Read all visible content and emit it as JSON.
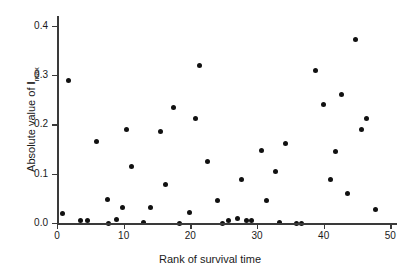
{
  "chart_data": {
    "type": "scatter",
    "title": "",
    "xlabel": "Rank of survival time",
    "ylabel_prefix": "Absolute value of ",
    "ylabel_symbol": "I",
    "ylabel_subscript": "max",
    "ylabel_full": "Absolute value of Imax",
    "xlim": [
      0,
      51
    ],
    "ylim": [
      0.0,
      0.42
    ],
    "xticks": [
      0,
      10,
      20,
      30,
      40,
      50
    ],
    "xtick_labels": [
      "0",
      "10",
      "20",
      "30",
      "40",
      "50"
    ],
    "yticks": [
      0.0,
      0.1,
      0.2,
      0.3,
      0.4
    ],
    "ytick_labels": [
      "0.0",
      "0.1",
      "0.2",
      "0.3",
      "0.4"
    ],
    "grid": false,
    "legend": null,
    "marker": "filled-circle",
    "marker_color": "#111111",
    "axis_color": "#3a3a3a",
    "background": "#ffffff",
    "x": [
      0.8,
      1.7,
      3.5,
      4.5,
      5.9,
      7.6,
      7.7,
      8.9,
      9.8,
      10.4,
      11.2,
      12.9,
      14.0,
      15.5,
      16.2,
      17.4,
      18.3,
      19.9,
      20.7,
      21.3,
      22.6,
      24.0,
      24.8,
      25.7,
      27.1,
      27.6,
      28.4,
      29.1,
      30.6,
      31.4,
      32.8,
      33.4,
      34.3,
      35.9,
      36.7,
      38.8,
      40.0,
      41.0,
      41.8,
      42.7,
      43.6,
      44.8,
      45.6,
      46.4,
      47.8
    ],
    "y": [
      0.02,
      0.29,
      0.006,
      0.006,
      0.165,
      0.047,
      0.0,
      0.008,
      0.032,
      0.19,
      0.114,
      0.002,
      0.031,
      0.185,
      0.079,
      0.234,
      0.0,
      0.021,
      0.213,
      0.319,
      0.124,
      0.046,
      0.0,
      0.005,
      0.009,
      0.088,
      0.006,
      0.005,
      0.148,
      0.045,
      0.104,
      0.002,
      0.161,
      0.0,
      0.0,
      0.31,
      0.24,
      0.088,
      0.145,
      0.26,
      0.059,
      0.372,
      0.19,
      0.212,
      0.028
    ],
    "n_points": 45
  },
  "points": [
    {
      "x": 0.8,
      "y": 0.02
    },
    {
      "x": 1.7,
      "y": 0.29
    },
    {
      "x": 3.5,
      "y": 0.006
    },
    {
      "x": 4.5,
      "y": 0.006
    },
    {
      "x": 5.9,
      "y": 0.165
    },
    {
      "x": 7.6,
      "y": 0.047
    },
    {
      "x": 7.7,
      "y": 0.0
    },
    {
      "x": 8.9,
      "y": 0.008
    },
    {
      "x": 9.8,
      "y": 0.032
    },
    {
      "x": 10.4,
      "y": 0.19
    },
    {
      "x": 11.2,
      "y": 0.114
    },
    {
      "x": 12.9,
      "y": 0.002
    },
    {
      "x": 14.0,
      "y": 0.031
    },
    {
      "x": 15.5,
      "y": 0.185
    },
    {
      "x": 16.2,
      "y": 0.079
    },
    {
      "x": 17.4,
      "y": 0.234
    },
    {
      "x": 18.3,
      "y": 0.0
    },
    {
      "x": 19.9,
      "y": 0.021
    },
    {
      "x": 20.7,
      "y": 0.213
    },
    {
      "x": 21.3,
      "y": 0.319
    },
    {
      "x": 22.6,
      "y": 0.124
    },
    {
      "x": 24.0,
      "y": 0.046
    },
    {
      "x": 24.8,
      "y": 0.0
    },
    {
      "x": 25.7,
      "y": 0.005
    },
    {
      "x": 27.1,
      "y": 0.009
    },
    {
      "x": 27.6,
      "y": 0.088
    },
    {
      "x": 28.4,
      "y": 0.006
    },
    {
      "x": 29.1,
      "y": 0.005
    },
    {
      "x": 30.6,
      "y": 0.148
    },
    {
      "x": 31.4,
      "y": 0.045
    },
    {
      "x": 32.8,
      "y": 0.104
    },
    {
      "x": 33.4,
      "y": 0.002
    },
    {
      "x": 34.3,
      "y": 0.161
    },
    {
      "x": 35.9,
      "y": 0.0
    },
    {
      "x": 36.7,
      "y": 0.0
    },
    {
      "x": 38.8,
      "y": 0.31
    },
    {
      "x": 40.0,
      "y": 0.24
    },
    {
      "x": 41.0,
      "y": 0.088
    },
    {
      "x": 41.8,
      "y": 0.145
    },
    {
      "x": 42.7,
      "y": 0.26
    },
    {
      "x": 43.6,
      "y": 0.059
    },
    {
      "x": 44.8,
      "y": 0.372
    },
    {
      "x": 45.6,
      "y": 0.19
    },
    {
      "x": 46.4,
      "y": 0.212
    },
    {
      "x": 47.8,
      "y": 0.028
    }
  ]
}
